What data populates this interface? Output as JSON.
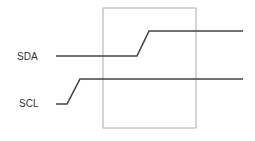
{
  "diagram": {
    "signals": [
      {
        "name": "SDA",
        "label_pos": [
          17,
          60
        ],
        "points": [
          [
            56,
            56
          ],
          [
            137,
            56
          ],
          [
            149,
            31
          ],
          [
            243,
            31
          ]
        ]
      },
      {
        "name": "SCL",
        "label_pos": [
          19,
          107
        ],
        "points": [
          [
            56,
            104
          ],
          [
            67,
            104
          ],
          [
            80,
            79
          ],
          [
            243,
            79
          ]
        ]
      }
    ],
    "window": {
      "x": 103,
      "y": 8,
      "width": 93,
      "height": 120
    },
    "colors": {
      "line": "#444444",
      "window": "#aaaaaa",
      "text": "#333333"
    }
  }
}
